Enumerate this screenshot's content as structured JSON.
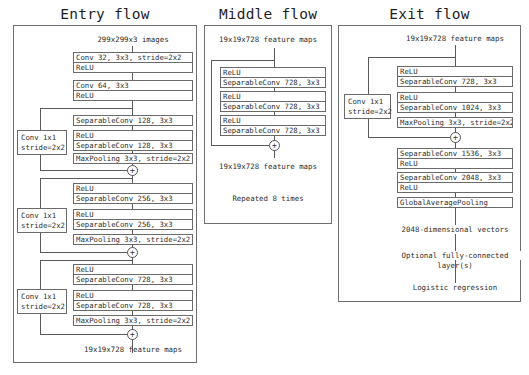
{
  "entry_flow": {
    "title": "Entry flow",
    "input_label": "299x299x3 images",
    "blocks": [
      {
        "rows": [
          "Conv 32, 3x3, stride=2x2",
          "ReLU"
        ]
      },
      {
        "rows": [
          "Conv 64, 3x3",
          "ReLU"
        ]
      },
      {
        "rows": [
          "SeparableConv 128, 3x3"
        ]
      },
      {
        "rows": [
          "ReLU",
          "SeparableConv 128, 3x3"
        ]
      },
      {
        "rows": [
          "MaxPooling 3x3, stride=2x2"
        ]
      },
      {
        "rows": [
          "ReLU",
          "SeparableConv 256, 3x3"
        ]
      },
      {
        "rows": [
          "ReLU",
          "SeparableConv 256, 3x3"
        ]
      },
      {
        "rows": [
          "MaxPooling 3x3, stride=2x2"
        ]
      },
      {
        "rows": [
          "ReLU",
          "SeparableConv 728, 3x3"
        ]
      },
      {
        "rows": [
          "ReLU",
          "SeparableConv 728, 3x3"
        ]
      },
      {
        "rows": [
          "MaxPooling 3x3, stride=2x2"
        ]
      }
    ],
    "skip_convs": [
      {
        "line1": "Conv 1x1",
        "line2": "stride=2x2"
      },
      {
        "line1": "Conv 1x1",
        "line2": "stride=2x2"
      },
      {
        "line1": "Conv 1x1",
        "line2": "stride=2x2"
      }
    ],
    "add_symbol": "+",
    "output_label": "19x19x728 feature maps"
  },
  "middle_flow": {
    "title": "Middle flow",
    "input_label": "19x19x728 feature maps",
    "blocks": [
      {
        "rows": [
          "ReLU",
          "SeparableConv 728, 3x3"
        ]
      },
      {
        "rows": [
          "ReLU",
          "SeparableConv 728, 3x3"
        ]
      },
      {
        "rows": [
          "ReLU",
          "SeparableConv 728, 3x3"
        ]
      }
    ],
    "add_symbol": "+",
    "output_label": "19x19x728 feature maps",
    "repeat_note": "Repeated 8 times"
  },
  "exit_flow": {
    "title": "Exit flow",
    "input_label": "19x19x728 feature maps",
    "blocks": [
      {
        "rows": [
          "ReLU",
          "SeparableConv 728, 3x3"
        ]
      },
      {
        "rows": [
          "ReLU",
          "SeparableConv 1024, 3x3"
        ]
      },
      {
        "rows": [
          "MaxPooling 3x3, stride=2x2"
        ]
      },
      {
        "rows": [
          "SeparableConv 1536, 3x3",
          "ReLU"
        ]
      },
      {
        "rows": [
          "SeparableConv 2048, 3x3",
          "ReLU"
        ]
      },
      {
        "rows": [
          "GlobalAveragePooling"
        ]
      }
    ],
    "skip_convs": [
      {
        "line1": "Conv 1x1",
        "line2": "stride=2x2"
      }
    ],
    "add_symbol": "+",
    "vector_label": "2048-dimensional vectors",
    "fc_label_line1": "Optional fully-connected",
    "fc_label_line2": "layer(s)",
    "output_label": "Logistic regression"
  }
}
